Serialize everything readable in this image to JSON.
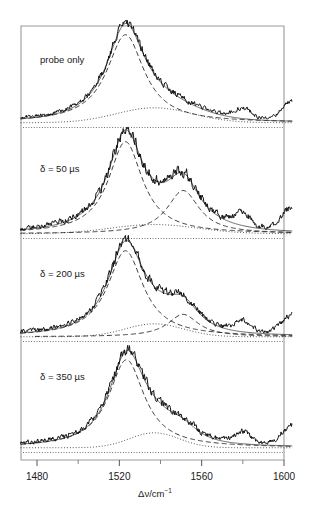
{
  "figure": {
    "type": "spectra-stack",
    "background": "#ffffff",
    "frame_color": "#9a9a9a",
    "trace_color": "#111111"
  },
  "axis": {
    "x_title_main": "Δν/cm",
    "x_title_sup": "−1",
    "ticks_major": [
      {
        "value": 1480,
        "label": "1480"
      },
      {
        "value": 1520,
        "label": "1520"
      },
      {
        "value": 1560,
        "label": "1560"
      },
      {
        "value": 1600,
        "label": "1600"
      }
    ],
    "ticks_minor": [
      1500,
      1540,
      1580
    ],
    "xlim": [
      1472,
      1604
    ]
  },
  "panels": [
    {
      "label": "probe only",
      "delay_us": null
    },
    {
      "label": "δ = 50 µs",
      "delay_us": 50
    },
    {
      "label": "δ = 200 µs",
      "delay_us": 200
    },
    {
      "label": "δ = 350 µs",
      "delay_us": 350
    }
  ],
  "chart_data": {
    "type": "line",
    "title": "",
    "subtitle": "",
    "xlabel": "Δν/cm−1",
    "ylabel": "",
    "xlim": [
      1472,
      1604
    ],
    "grid": false,
    "legend": "none",
    "x_ticks": [
      1480,
      1520,
      1560,
      1600
    ],
    "x_minor_ticks": [
      1500,
      1540,
      1580
    ],
    "panel_count": 4,
    "panels": [
      {
        "name": "probe only",
        "label": "probe only",
        "components": [
          {
            "name": "main-band-fit",
            "style": "dashed",
            "center": 1523.0,
            "width": 11.0,
            "amplitude": 1.0
          },
          {
            "name": "second-band-fit",
            "style": "dashed",
            "center": 1551.0,
            "width": 9.0,
            "amplitude": 0.0
          },
          {
            "name": "broad-background",
            "style": "dotted",
            "center": 1537.0,
            "width": 26.0,
            "amplitude": 0.17
          },
          {
            "name": "weak-band",
            "style": "noise",
            "center": 1580.0,
            "width": 5.5,
            "amplitude": 0.11
          },
          {
            "name": "edge-rise",
            "style": "noise",
            "center": 1604.0,
            "width": 7.0,
            "amplitude": 0.2
          }
        ],
        "noise_level": 0.03,
        "baseline": 0.02
      },
      {
        "name": "delay-50us",
        "label": "δ = 50 µs",
        "components": [
          {
            "name": "main-band-fit",
            "style": "dashed",
            "center": 1523.0,
            "width": 10.0,
            "amplitude": 1.0
          },
          {
            "name": "second-band-fit",
            "style": "dashed",
            "center": 1551.0,
            "width": 9.5,
            "amplitude": 0.47
          },
          {
            "name": "broad-background",
            "style": "dotted",
            "center": 1537.0,
            "width": 30.0,
            "amplitude": 0.1
          },
          {
            "name": "weak-band",
            "style": "noise",
            "center": 1580.0,
            "width": 5.5,
            "amplitude": 0.12
          },
          {
            "name": "edge-rise",
            "style": "noise",
            "center": 1604.0,
            "width": 7.0,
            "amplitude": 0.24
          }
        ],
        "noise_level": 0.04,
        "baseline": 0.02
      },
      {
        "name": "delay-200us",
        "label": "δ = 200 µs",
        "components": [
          {
            "name": "main-band-fit",
            "style": "dashed",
            "center": 1523.0,
            "width": 10.5,
            "amplitude": 1.0
          },
          {
            "name": "second-band-fit",
            "style": "dashed",
            "center": 1551.0,
            "width": 9.0,
            "amplitude": 0.26
          },
          {
            "name": "broad-background",
            "style": "dotted",
            "center": 1537.0,
            "width": 20.0,
            "amplitude": 0.15
          },
          {
            "name": "weak-band",
            "style": "noise",
            "center": 1580.0,
            "width": 5.5,
            "amplitude": 0.11
          },
          {
            "name": "edge-rise",
            "style": "noise",
            "center": 1604.0,
            "width": 7.0,
            "amplitude": 0.22
          }
        ],
        "noise_level": 0.035,
        "baseline": 0.02
      },
      {
        "name": "delay-350us",
        "label": "δ = 350 µs",
        "components": [
          {
            "name": "main-band-fit",
            "style": "dashed",
            "center": 1523.5,
            "width": 10.5,
            "amplitude": 1.0
          },
          {
            "name": "second-band-fit",
            "style": "dashed",
            "center": 1551.0,
            "width": 9.5,
            "amplitude": 0.12
          },
          {
            "name": "broad-background",
            "style": "dotted",
            "center": 1537.0,
            "width": 17.0,
            "amplitude": 0.17
          },
          {
            "name": "weak-band",
            "style": "noise",
            "center": 1580.0,
            "width": 5.5,
            "amplitude": 0.13
          },
          {
            "name": "edge-rise",
            "style": "noise",
            "center": 1604.0,
            "width": 7.0,
            "amplitude": 0.22
          }
        ],
        "noise_level": 0.035,
        "baseline": 0.02
      }
    ]
  }
}
